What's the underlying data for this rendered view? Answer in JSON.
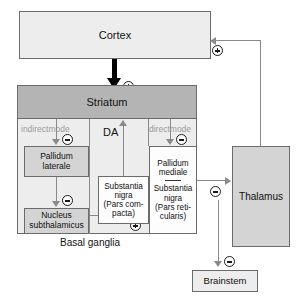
{
  "diagram": {
    "region_label": "Basal ganglia",
    "da_label": "DA",
    "indirect_mode": "indirect\nmode",
    "direct_mode": "direct\nmode",
    "colors": {
      "cortex_fill": "#ededed",
      "striatum_fill": "#b4b4b4",
      "basal_ganglia_fill": "#ededed",
      "pallidum_lateral_fill": "#d4d4d4",
      "nucleus_subthalamicus_fill": "#d4d4d4",
      "substantia_nigra_compacta_fill": "#fdfdfd",
      "pallidum_mediale_fill": "#fdfdfd",
      "thalamus_fill": "#d4d4d4",
      "brainstem_fill": "#ededed",
      "line": "#8a8a8a",
      "strong_line": "#000000",
      "mode_text": "#9a9a9a"
    }
  },
  "nodes": {
    "cortex": {
      "label": "Cortex"
    },
    "striatum": {
      "label": "Striatum"
    },
    "pallidum_laterale": {
      "line1": "Pallidum",
      "line2": "laterale"
    },
    "nucleus_subthalamicus": {
      "line1": "Nucleus",
      "line2": "subthalamicus"
    },
    "substantia_nigra_compacta": {
      "line1": "Substantia",
      "line2": "nigra",
      "line3": "(Pars com-",
      "line4": "pacta)"
    },
    "pallidum_mediale": {
      "line1": "Pallidum",
      "line2": "mediale",
      "line3": "Substantia",
      "line4": "nigra",
      "line5": "(Pars reti-",
      "line6": "cularis)"
    },
    "thalamus": {
      "label": "Thalamus"
    },
    "brainstem": {
      "label": "Brainstem"
    }
  },
  "signs": {
    "thalamus_to_cortex": "+",
    "cortex_to_striatum": "+",
    "striatum_to_pallidum_laterale": "−",
    "striatum_to_pallidum_mediale": "−",
    "pallidum_laterale_to_nucleus_subthalamicus": "−",
    "nucleus_subthalamicus_to_pallidum_mediale": "+",
    "pallidum_mediale_to_thalamus": "−",
    "pallidum_mediale_to_brainstem": "−"
  },
  "edges": [
    {
      "from": "thalamus",
      "to": "cortex",
      "sign": "+"
    },
    {
      "from": "cortex",
      "to": "striatum",
      "sign": "+"
    },
    {
      "from": "striatum",
      "to": "pallidum_laterale",
      "sign": "−",
      "pathway": "indirect mode"
    },
    {
      "from": "striatum",
      "to": "pallidum_mediale",
      "sign": "−",
      "pathway": "direct mode"
    },
    {
      "from": "pallidum_laterale",
      "to": "nucleus_subthalamicus",
      "sign": "−"
    },
    {
      "from": "nucleus_subthalamicus",
      "to": "pallidum_mediale",
      "sign": "+"
    },
    {
      "from": "substantia_nigra_compacta",
      "to": "striatum",
      "sign": "DA"
    },
    {
      "from": "pallidum_mediale",
      "to": "thalamus",
      "sign": "−"
    },
    {
      "from": "pallidum_mediale",
      "to": "brainstem",
      "sign": "−"
    }
  ]
}
